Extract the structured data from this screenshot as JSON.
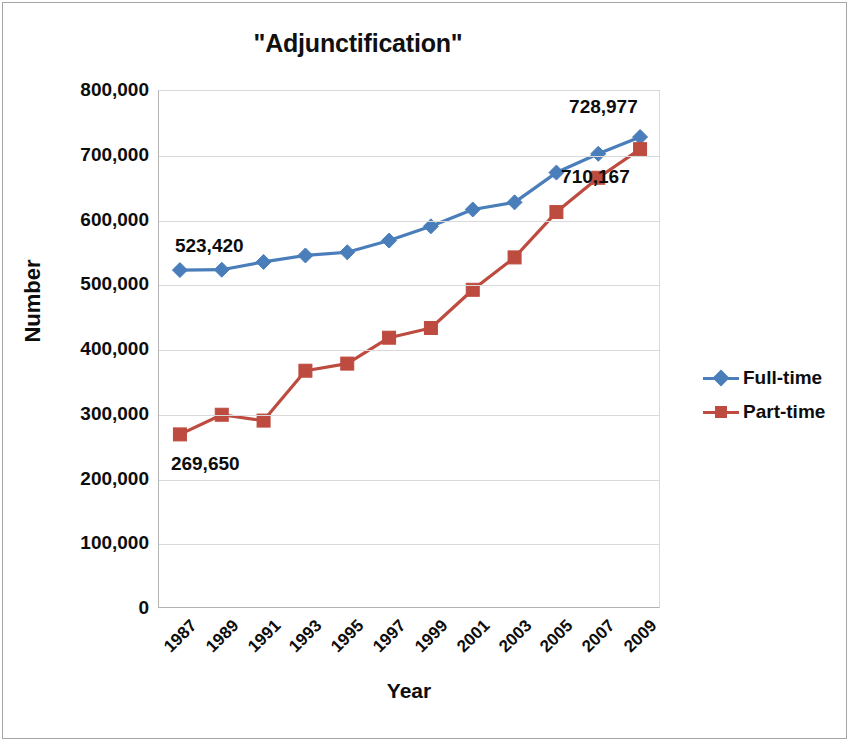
{
  "chart_data": {
    "type": "line",
    "title": "\"Adjunctification\"",
    "xlabel": "Year",
    "ylabel": "Number",
    "categories": [
      "1987",
      "1989",
      "1991",
      "1993",
      "1995",
      "1997",
      "1999",
      "2001",
      "2003",
      "2005",
      "2007",
      "2009"
    ],
    "ylim": [
      0,
      800000
    ],
    "yticks": [
      "0",
      "100,000",
      "200,000",
      "300,000",
      "400,000",
      "500,000",
      "600,000",
      "700,000",
      "800,000"
    ],
    "ytick_values": [
      0,
      100000,
      200000,
      300000,
      400000,
      500000,
      600000,
      700000,
      800000
    ],
    "grid": true,
    "legend_position": "right",
    "series": [
      {
        "name": "Full-time",
        "color": "#4A7EBB",
        "marker": "diamond",
        "values": [
          523420,
          524000,
          536000,
          546000,
          551000,
          569000,
          591000,
          617000,
          628000,
          674000,
          703000,
          728977
        ]
      },
      {
        "name": "Part-time",
        "color": "#BE4B3F",
        "marker": "square",
        "values": [
          269650,
          300000,
          291000,
          368000,
          379000,
          419000,
          434000,
          493000,
          543000,
          613000,
          666000,
          710167
        ]
      }
    ],
    "annotations": [
      {
        "text": "523,420",
        "series": "Full-time",
        "category": "1987"
      },
      {
        "text": "728,977",
        "series": "Full-time",
        "category": "2009"
      },
      {
        "text": "269,650",
        "series": "Part-time",
        "category": "1987"
      },
      {
        "text": "710,167",
        "series": "Part-time",
        "category": "2009"
      }
    ]
  },
  "legend": {
    "items": [
      {
        "label": "Full-time"
      },
      {
        "label": "Part-time"
      }
    ]
  }
}
